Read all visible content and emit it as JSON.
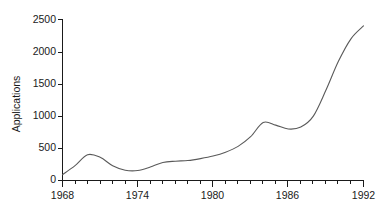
{
  "chart_data": {
    "type": "line",
    "title": "",
    "xlabel": "",
    "ylabel": "Applications",
    "xlim": [
      1968,
      1992
    ],
    "ylim": [
      0,
      2500
    ],
    "grid": false,
    "legend": false,
    "y_ticks": [
      0,
      500,
      1000,
      1500,
      2000,
      2500
    ],
    "y_tick_labels": [
      "0",
      "500",
      "1000",
      "1500",
      "2000",
      "2500"
    ],
    "x_ticks": [
      1968,
      1974,
      1980,
      1986,
      1992
    ],
    "x_tick_labels": [
      "1968",
      "1974",
      "1980",
      "1986",
      "1992"
    ],
    "x_minor_tick_interval": 1,
    "series": [
      {
        "name": "Applications",
        "color": "#5a5a5a",
        "x": [
          1968,
          1969,
          1970,
          1971,
          1972,
          1973,
          1974,
          1975,
          1976,
          1977,
          1978,
          1979,
          1980,
          1981,
          1982,
          1983,
          1984,
          1985,
          1986,
          1987,
          1988,
          1989,
          1990,
          1991,
          1992
        ],
        "values": [
          90,
          230,
          400,
          360,
          230,
          160,
          155,
          210,
          280,
          300,
          310,
          340,
          380,
          440,
          530,
          680,
          900,
          860,
          800,
          830,
          1000,
          1400,
          1850,
          2200,
          2400
        ]
      }
    ]
  },
  "axis": {
    "y_title": "Applications"
  }
}
